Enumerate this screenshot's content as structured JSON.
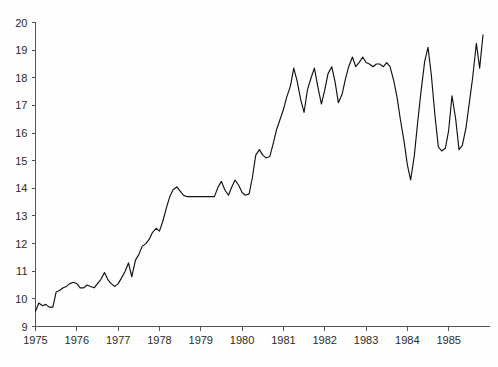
{
  "chart_data": {
    "type": "line",
    "title": "",
    "subtitle": "",
    "xlabel": "",
    "ylabel": "",
    "xlim": [
      1975.0,
      1986.0
    ],
    "ylim": [
      9,
      20
    ],
    "grid": false,
    "legend": null,
    "y_ticks": [
      9,
      10,
      11,
      12,
      13,
      14,
      15,
      16,
      17,
      18,
      19,
      20
    ],
    "y_tick_labels": [
      "9",
      "10",
      "11",
      "12",
      "13",
      "14",
      "15",
      "16",
      "17",
      "18",
      "19",
      "20"
    ],
    "x_ticks": [
      1975,
      1976,
      1977,
      1978,
      1979,
      1980,
      1981,
      1982,
      1983,
      1984,
      1985
    ],
    "x_tick_labels": [
      "1975",
      "1976",
      "1977",
      "1978",
      "1979",
      "1980",
      "1981",
      "1982",
      "1983",
      "1984",
      "1985"
    ],
    "series": [
      {
        "name": "series-1",
        "color": "#111111",
        "x": [
          1975.0,
          1975.08,
          1975.17,
          1975.25,
          1975.33,
          1975.42,
          1975.5,
          1975.58,
          1975.67,
          1975.75,
          1975.83,
          1975.92,
          1976.0,
          1976.08,
          1976.17,
          1976.25,
          1976.33,
          1976.42,
          1976.5,
          1976.58,
          1976.67,
          1976.75,
          1976.83,
          1976.92,
          1977.0,
          1977.08,
          1977.17,
          1977.25,
          1977.33,
          1977.42,
          1977.5,
          1977.58,
          1977.67,
          1977.75,
          1977.83,
          1977.92,
          1978.0,
          1978.08,
          1978.17,
          1978.25,
          1978.33,
          1978.42,
          1978.5,
          1978.58,
          1978.67,
          1978.75,
          1978.83,
          1978.92,
          1979.0,
          1979.08,
          1979.17,
          1979.25,
          1979.33,
          1979.42,
          1979.5,
          1979.58,
          1979.67,
          1979.75,
          1979.83,
          1979.92,
          1980.0,
          1980.08,
          1980.17,
          1980.25,
          1980.33,
          1980.42,
          1980.5,
          1980.58,
          1980.67,
          1980.75,
          1980.83,
          1980.92,
          1981.0,
          1981.08,
          1981.17,
          1981.25,
          1981.33,
          1981.42,
          1981.5,
          1981.58,
          1981.67,
          1981.75,
          1981.83,
          1981.92,
          1982.0,
          1982.08,
          1982.17,
          1982.25,
          1982.33,
          1982.42,
          1982.5,
          1982.58,
          1982.67,
          1982.75,
          1982.83,
          1982.92,
          1983.0,
          1983.08,
          1983.17,
          1983.25,
          1983.33,
          1983.42,
          1983.5,
          1983.58,
          1983.67,
          1983.75,
          1983.83,
          1983.92,
          1984.0,
          1984.08,
          1984.17,
          1984.25,
          1984.33,
          1984.42,
          1984.5,
          1984.58,
          1984.67,
          1984.75,
          1984.83,
          1984.92,
          1985.0,
          1985.08,
          1985.17,
          1985.25,
          1985.33,
          1985.42,
          1985.5,
          1985.58,
          1985.67,
          1985.75,
          1985.83
        ],
        "y": [
          9.55,
          9.85,
          9.75,
          9.8,
          9.7,
          9.7,
          10.25,
          10.3,
          10.4,
          10.45,
          10.55,
          10.6,
          10.55,
          10.4,
          10.4,
          10.5,
          10.45,
          10.4,
          10.55,
          10.7,
          10.95,
          10.7,
          10.55,
          10.45,
          10.55,
          10.75,
          11.0,
          11.3,
          10.8,
          11.4,
          11.6,
          11.9,
          12.0,
          12.15,
          12.4,
          12.55,
          12.45,
          12.8,
          13.3,
          13.7,
          13.95,
          14.05,
          13.9,
          13.75,
          13.7,
          13.7,
          13.7,
          13.7,
          13.7,
          13.7,
          13.7,
          13.7,
          13.7,
          14.05,
          14.25,
          13.95,
          13.75,
          14.05,
          14.3,
          14.1,
          13.85,
          13.75,
          13.8,
          14.4,
          15.2,
          15.4,
          15.2,
          15.1,
          15.15,
          15.6,
          16.1,
          16.5,
          16.85,
          17.3,
          17.7,
          18.35,
          17.9,
          17.2,
          16.75,
          17.55,
          18.0,
          18.35,
          17.7,
          17.05,
          17.55,
          18.15,
          18.4,
          17.85,
          17.1,
          17.4,
          17.95,
          18.4,
          18.75,
          18.4,
          18.55,
          18.75,
          18.55,
          18.5,
          18.4,
          18.5,
          18.5,
          18.4,
          18.55,
          18.4,
          17.9,
          17.3,
          16.5,
          15.7,
          14.85,
          14.3,
          15.2,
          16.4,
          17.5,
          18.6,
          19.1,
          18.1,
          16.6,
          15.5,
          15.35,
          15.45,
          16.1,
          17.35,
          16.5,
          15.4,
          15.55,
          16.2,
          17.1,
          18.0,
          19.25,
          18.35,
          19.55
        ]
      }
    ]
  },
  "figure": {
    "background_color": "#ffffff",
    "axis_color": "#555555",
    "line_color": "#111111"
  }
}
